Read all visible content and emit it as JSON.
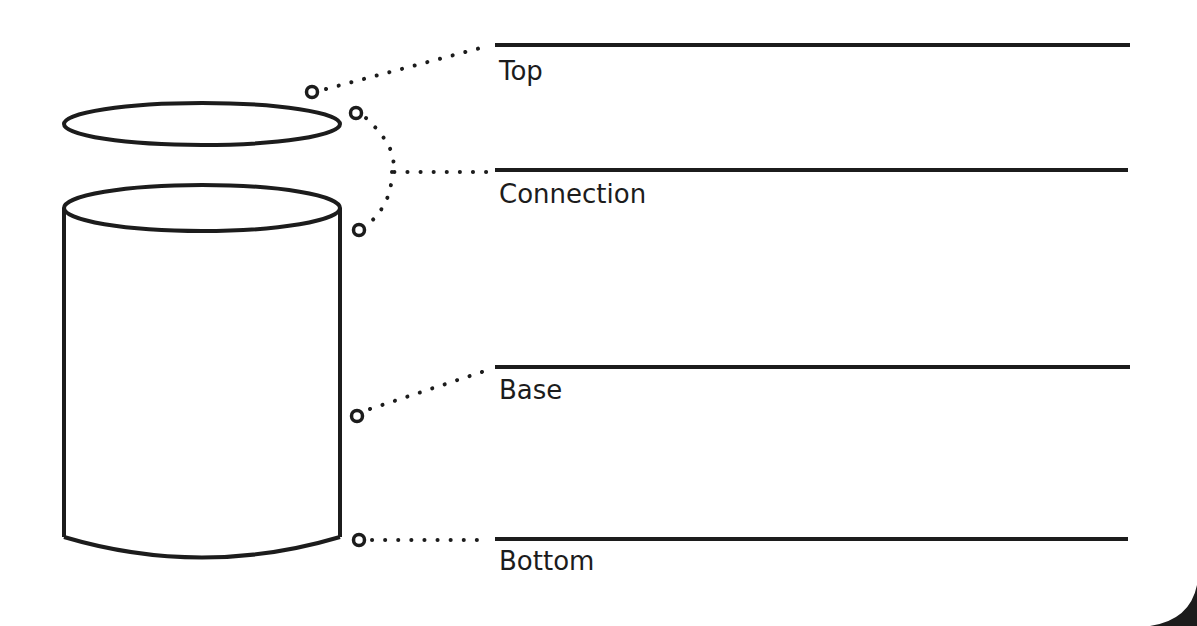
{
  "diagram": {
    "stroke_color": "#1c1c1c",
    "background": "#ffffff",
    "labels": [
      {
        "id": "top",
        "text": "Top",
        "line_y": 45
      },
      {
        "id": "connection",
        "text": "Connection",
        "line_y": 170
      },
      {
        "id": "base",
        "text": "Base",
        "line_y": 367
      },
      {
        "id": "bottom",
        "text": "Bottom",
        "line_y": 539
      }
    ]
  }
}
